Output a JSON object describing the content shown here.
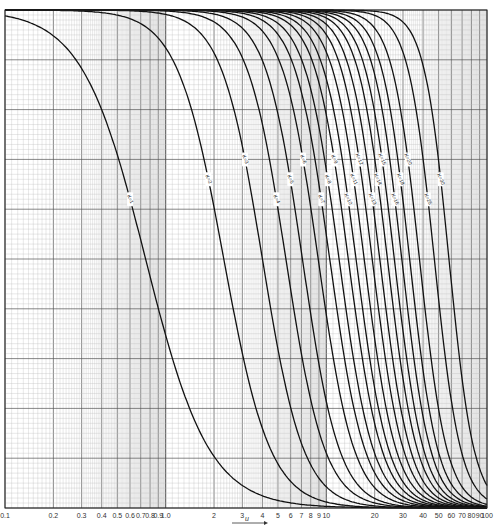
{
  "chart_data": {
    "type": "line",
    "title": "",
    "xlabel": "u",
    "ylabel": "",
    "xscale": "log",
    "xlim": [
      0.1,
      100
    ],
    "ylim": [
      0,
      1
    ],
    "grid": true,
    "legend": "none (inline curve labels K=...)",
    "x_ticks": [
      "0.1",
      "0.2",
      "0.3",
      "0.4",
      "0.5",
      "0.6",
      "0.7",
      "0.8",
      "0.9",
      "1.0",
      "2",
      "3",
      "4",
      "5",
      "6",
      "7",
      "8",
      "9",
      "10",
      "20",
      "30",
      "40",
      "50",
      "60",
      "70",
      "80",
      "90",
      "100"
    ],
    "series": [
      {
        "name": "K=1",
        "u_mid": 0.75,
        "steep": 2.2
      },
      {
        "name": "K=2",
        "u_mid": 2.3,
        "steep": 3.0
      },
      {
        "name": "K=3",
        "u_mid": 4.0,
        "steep": 3.4
      },
      {
        "name": "K=4",
        "u_mid": 5.6,
        "steep": 3.6
      },
      {
        "name": "K=5",
        "u_mid": 7.1,
        "steep": 3.8
      },
      {
        "name": "K=6",
        "u_mid": 8.9,
        "steep": 3.9
      },
      {
        "name": "K=7",
        "u_mid": 10.5,
        "steep": 4.0
      },
      {
        "name": "K=8",
        "u_mid": 12.0,
        "steep": 4.1
      },
      {
        "name": "K=9",
        "u_mid": 13.7,
        "steep": 4.2
      },
      {
        "name": "K=10",
        "u_mid": 15.3,
        "steep": 4.3
      },
      {
        "name": "K=11",
        "u_mid": 17.2,
        "steep": 4.4
      },
      {
        "name": "K=12",
        "u_mid": 19.3,
        "steep": 4.5
      },
      {
        "name": "K=13",
        "u_mid": 21.5,
        "steep": 4.6
      },
      {
        "name": "K=14",
        "u_mid": 24.0,
        "steep": 4.7
      },
      {
        "name": "K=15",
        "u_mid": 26.5,
        "steep": 4.8
      },
      {
        "name": "K=16",
        "u_mid": 29.5,
        "steep": 4.9
      },
      {
        "name": "K=18",
        "u_mid": 33.0,
        "steep": 5.0
      },
      {
        "name": "K=20",
        "u_mid": 38.0,
        "steep": 5.1
      },
      {
        "name": "K=25",
        "u_mid": 47.0,
        "steep": 5.3
      },
      {
        "name": "K=30",
        "u_mid": 58.0,
        "steep": 5.6
      }
    ]
  }
}
